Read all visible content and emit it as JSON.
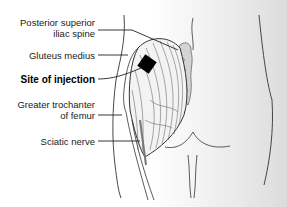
{
  "figure": {
    "labels": [
      {
        "id": "psis",
        "line1": "Posterior superior",
        "line2": "iliac spine",
        "bold": false
      },
      {
        "id": "gluteus_medius",
        "line1": "Gluteus medius",
        "bold": false
      },
      {
        "id": "injection_site",
        "line1": "Site of injection",
        "bold": true
      },
      {
        "id": "greater_trochanter",
        "line1": "Greater trochanter",
        "line2": "of femur",
        "bold": false
      },
      {
        "id": "sciatic_nerve",
        "line1": "Sciatic nerve",
        "bold": false
      }
    ],
    "colors": {
      "line": "#2a2a2a",
      "injection_marker": "#000000",
      "sacrum_fill": "#d4d4d4",
      "background_gradient_end": "#dcdcdc"
    }
  }
}
